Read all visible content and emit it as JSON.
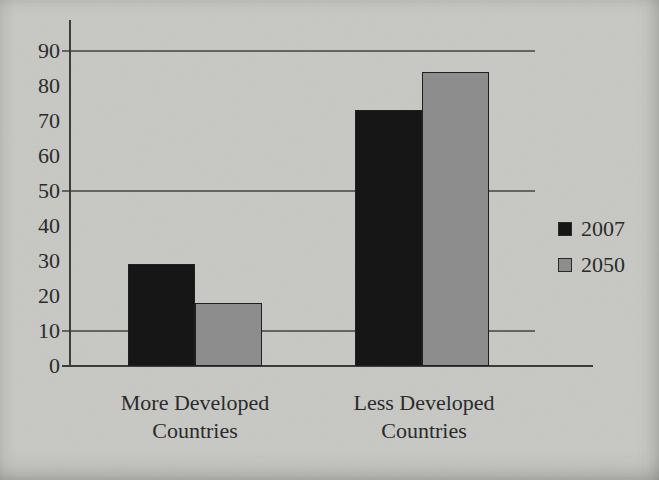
{
  "chart_data": {
    "type": "bar",
    "title": "",
    "xlabel": "",
    "ylabel": "",
    "categories": [
      "More Developed Countries",
      "Less Developed Countries"
    ],
    "series": [
      {
        "name": "2007",
        "color": "#161616",
        "values": [
          29,
          73
        ]
      },
      {
        "name": "2050",
        "color": "#8d8d8d",
        "values": [
          18,
          84
        ]
      }
    ],
    "ylim": [
      0,
      90
    ],
    "yticks": [
      0,
      10,
      20,
      30,
      40,
      50,
      60,
      70,
      80,
      90
    ],
    "gridline_values": [
      10,
      50,
      90
    ],
    "grid": true,
    "legend_position": "right"
  },
  "colors": {
    "background": "#c7c8c4",
    "axis": "#3c3c3c",
    "gridline": "#646464",
    "text": "#2b2b2b",
    "bar_border": "#1f1f1f"
  }
}
